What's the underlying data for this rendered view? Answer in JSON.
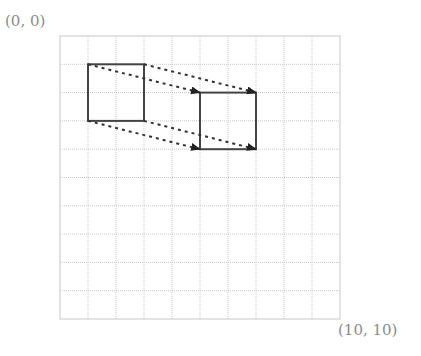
{
  "diagram": {
    "type": "grid-translation",
    "grid": {
      "cols": 10,
      "rows": 10,
      "origin_label": "(0, 0)",
      "end_label": "(10, 10)"
    },
    "source_square": {
      "x": 1,
      "y": 1,
      "w": 2,
      "h": 2
    },
    "target_square": {
      "x": 5,
      "y": 2,
      "w": 2,
      "h": 2
    },
    "translation": {
      "dx": 4,
      "dy": 1
    },
    "colors": {
      "grid": "#c8c8c8",
      "square": "#444444",
      "arrow": "#333333",
      "label": "#8c8c8c"
    }
  }
}
